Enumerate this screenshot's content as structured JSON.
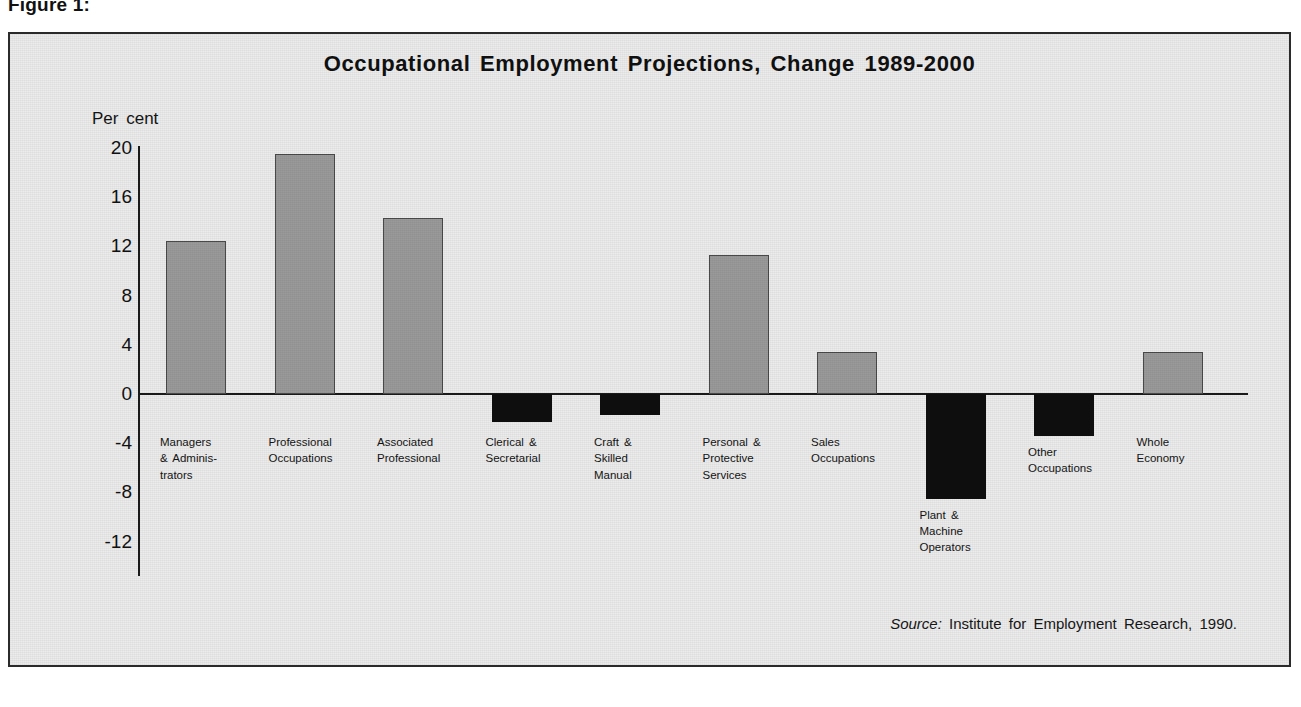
{
  "figure": {
    "caption": "Figure 1:"
  },
  "chart_data": {
    "type": "bar",
    "title": "Occupational Employment Projections, Change 1989-2000",
    "xlabel": "",
    "ylabel": "Per cent",
    "ylim": [
      -12,
      20
    ],
    "yticks": [
      20,
      16,
      12,
      8,
      4,
      0,
      -4,
      -8,
      -12
    ],
    "ytick_labels": [
      "20",
      "16",
      "12",
      "8",
      "4",
      "0",
      "-4",
      "-8",
      "-12"
    ],
    "grid": false,
    "legend": null,
    "categories": [
      "Managers\n& Adminis-\ntrators",
      "Professional\nOccupations",
      "Associated\nProfessional",
      "Clerical &\nSecretarial",
      "Craft &\nSkilled\nManual",
      "Personal &\nProtective\nServices",
      "Sales\nOccupations",
      "Plant &\nMachine\nOperators",
      "Other\nOccupations",
      "Whole\nEconomy"
    ],
    "values": [
      12.4,
      19.5,
      14.3,
      -2.3,
      -1.7,
      11.3,
      3.4,
      -8.5,
      -3.4,
      3.4
    ],
    "colors": {
      "positive_fill": "#9a9a9a",
      "positive_stroke": "#4a4a4a",
      "negative_fill": "#0e0e0e",
      "axis": "#1b1b1b",
      "panel_background": "#ececec",
      "panel_border": "#2b2b2b"
    },
    "annotations": {
      "source_prefix": "Source:",
      "source_text": "Institute for Employment Research, 1990."
    }
  }
}
